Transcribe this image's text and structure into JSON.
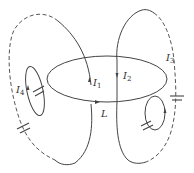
{
  "figure": {
    "labels": {
      "I1": {
        "main": "I",
        "sub": "1"
      },
      "I2": {
        "main": "I",
        "sub": "2"
      },
      "I3": {
        "main": "I",
        "sub": "3"
      },
      "I4": {
        "main": "I",
        "sub": "4"
      },
      "L": "L"
    },
    "colors": {
      "stroke": "#444444",
      "text": "#333333",
      "background": "#ffffff"
    }
  }
}
